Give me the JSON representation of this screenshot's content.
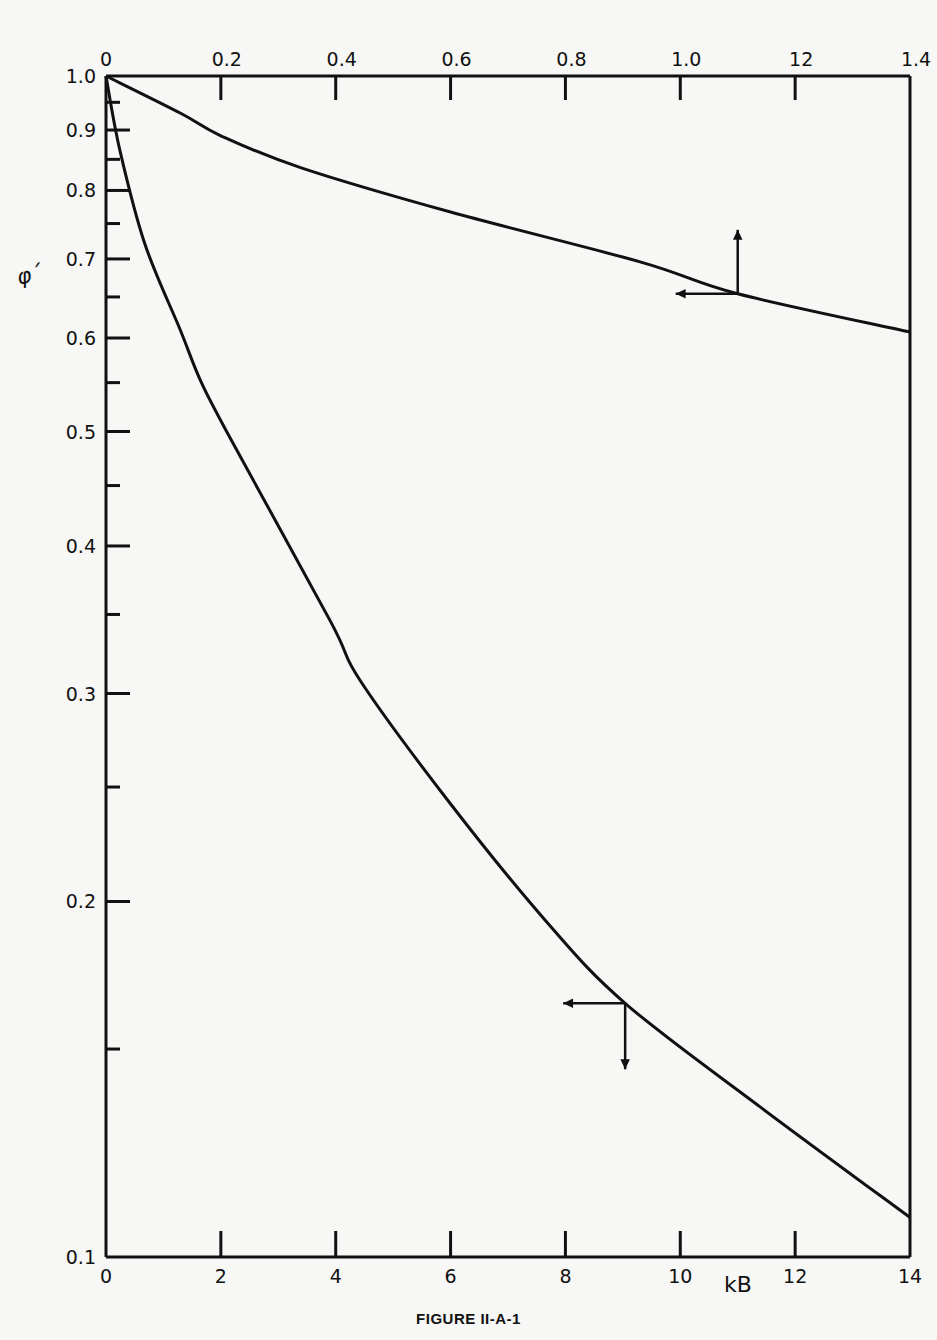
{
  "figure": {
    "caption": "FIGURE II-A-1",
    "y_symbol": "φ´",
    "x_label_bottom": "kB"
  },
  "chart_data": {
    "type": "line",
    "title": "",
    "caption": "FIGURE II-A-1",
    "xlabel": "kB",
    "ylabel": "φ´",
    "yscale": "log",
    "ylim": [
      0.1,
      1.0
    ],
    "grid": false,
    "legend": null,
    "x_bottom": {
      "range": [
        0,
        14
      ],
      "ticks": [
        0,
        2,
        4,
        6,
        8,
        10,
        12,
        14
      ],
      "tick_labels": [
        "0",
        "2",
        "4",
        "6",
        "8",
        "10",
        "12",
        "14"
      ]
    },
    "x_top": {
      "range": [
        0,
        1.4
      ],
      "ticks": [
        0,
        0.2,
        0.4,
        0.6,
        0.8,
        1.0,
        1.2,
        1.4
      ],
      "tick_labels": [
        "0",
        "0.2",
        "0.4",
        "0.6",
        "0.8",
        "1.0",
        "12",
        "1.4"
      ]
    },
    "y_ticks": [
      1.0,
      0.9,
      0.8,
      0.7,
      0.6,
      0.5,
      0.4,
      0.3,
      0.2,
      0.1
    ],
    "y_tick_labels": [
      "1.0",
      "0.9",
      "0.8",
      "0.7",
      "0.6",
      "0.5",
      "0.4",
      "0.3",
      "0.2",
      "0.1"
    ],
    "y_minor_ticks": [
      0.95,
      0.85,
      0.75,
      0.65,
      0.55,
      0.45,
      0.35,
      0.25,
      0.15
    ],
    "series": [
      {
        "name": "upper curve (read on top axis, kB 0–1.4)",
        "axis": "top",
        "x": [
          0,
          0.13,
          0.2,
          0.34,
          0.6,
          0.93,
          1.1,
          1.4
        ],
        "y": [
          1.0,
          0.93,
          0.89,
          0.836,
          0.767,
          0.696,
          0.654,
          0.607
        ]
      },
      {
        "name": "lower curve (read on bottom axis, kB 0–14)",
        "axis": "bottom",
        "x": [
          0,
          0.24,
          0.68,
          1.29,
          1.64,
          2.1,
          3.9,
          4.42,
          5.94,
          7.64,
          9.04,
          11.39,
          14
        ],
        "y": [
          1.0,
          0.866,
          0.72,
          0.61,
          0.553,
          0.5,
          0.346,
          0.308,
          0.244,
          0.193,
          0.164,
          0.134,
          0.108
        ]
      }
    ],
    "annotations": [
      {
        "type": "arrow-pair",
        "at": {
          "x": 1.1,
          "y": 0.654
        },
        "directions": [
          "left",
          "up"
        ],
        "meaning": "upper curve reads on left and top axes"
      },
      {
        "type": "arrow-pair",
        "at": {
          "x": 9.04,
          "y": 0.164
        },
        "directions": [
          "left",
          "down"
        ],
        "meaning": "lower curve reads on left and bottom axes"
      }
    ]
  }
}
